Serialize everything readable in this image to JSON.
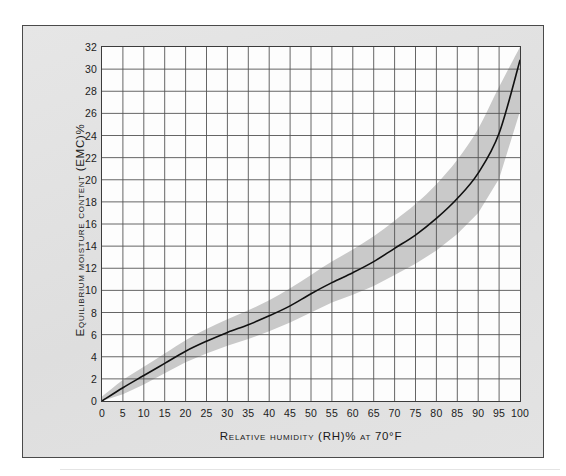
{
  "figure": {
    "background_color": "#ffffff",
    "panel_color": "#e2e2e2",
    "panel_border_color": "#4a4a4a",
    "plot_background_color": "#fdfdfd",
    "grid_color": "#555555",
    "curve_color": "#111111",
    "band_color": "#c9c9c9"
  },
  "chart_data": {
    "type": "line",
    "title": "",
    "xlabel": "Relative humidity (RH)% at 70°F",
    "ylabel": "Equilibrium moisture content (EMC)%",
    "xlim": [
      0,
      100
    ],
    "ylim": [
      0,
      32
    ],
    "xticks": [
      0,
      5,
      10,
      15,
      20,
      25,
      30,
      35,
      40,
      45,
      50,
      55,
      60,
      65,
      70,
      75,
      80,
      85,
      90,
      95,
      100
    ],
    "yticks": [
      0,
      2,
      4,
      6,
      8,
      10,
      12,
      14,
      16,
      18,
      20,
      22,
      24,
      26,
      28,
      30,
      32
    ],
    "xtick_labels": [
      "0",
      "5",
      "10",
      "15",
      "20",
      "25",
      "30",
      "35",
      "40",
      "45",
      "50",
      "55",
      "60",
      "65",
      "70",
      "75",
      "80",
      "85",
      "90",
      "95",
      "100"
    ],
    "ytick_labels": [
      "0",
      "2",
      "4",
      "6",
      "8",
      "10",
      "12",
      "14",
      "16",
      "18",
      "20",
      "22",
      "24",
      "26",
      "28",
      "30",
      "32"
    ],
    "grid": true,
    "legend": false,
    "x": [
      0,
      5,
      10,
      15,
      20,
      25,
      30,
      35,
      40,
      45,
      50,
      55,
      60,
      65,
      70,
      75,
      80,
      85,
      90,
      95,
      100
    ],
    "series": [
      {
        "name": "Equilibrium moisture content",
        "values": [
          0.0,
          1.2,
          2.3,
          3.4,
          4.5,
          5.4,
          6.2,
          6.9,
          7.7,
          8.6,
          9.7,
          10.7,
          11.6,
          12.6,
          13.8,
          15.0,
          16.5,
          18.3,
          20.6,
          24.2,
          30.8
        ]
      },
      {
        "name": "Upper band",
        "values": [
          0.4,
          1.9,
          3.1,
          4.3,
          5.5,
          6.5,
          7.4,
          8.2,
          9.1,
          10.2,
          11.4,
          12.6,
          13.7,
          14.9,
          16.3,
          17.8,
          19.6,
          21.8,
          24.6,
          28.4,
          32.0
        ]
      },
      {
        "name": "Lower band",
        "values": [
          0.0,
          0.6,
          1.5,
          2.5,
          3.5,
          4.3,
          5.0,
          5.6,
          6.3,
          7.1,
          8.0,
          8.9,
          9.6,
          10.4,
          11.4,
          12.4,
          13.6,
          15.1,
          17.0,
          20.1,
          26.2
        ]
      }
    ],
    "annotations": []
  }
}
